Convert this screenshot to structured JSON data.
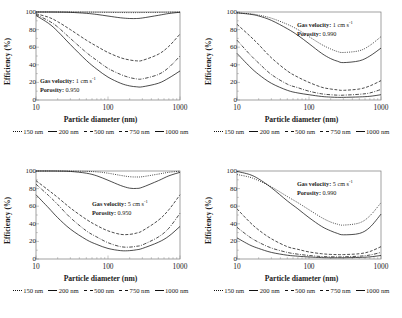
{
  "figure": {
    "axis": {
      "ylabel": "Efficiency (%)",
      "xlabel": "Particle diameter (nm)",
      "yticks": [
        "0",
        "20",
        "40",
        "60",
        "80",
        "100"
      ],
      "xticks": [
        "10",
        "100",
        "1000"
      ],
      "ylim": [
        0,
        100
      ],
      "xlim": [
        10,
        1000
      ],
      "xscale": "log"
    },
    "legend": {
      "entries": [
        {
          "label": "150 nm",
          "dash": "1,1.2",
          "width": 0.75
        },
        {
          "label": "200 nm",
          "dash": "none",
          "width": 0.75
        },
        {
          "label": "500 nm",
          "dash": "3,1.6",
          "width": 0.75
        },
        {
          "label": "750 nm",
          "dash": "3.5,1.4,0.9,1.4",
          "width": 0.75
        },
        {
          "label": "1000 nm",
          "dash": "none",
          "width": 0.85
        }
      ]
    },
    "panels": [
      {
        "id": "top-left",
        "annotation": {
          "gas_velocity_label": "Gas velocity:",
          "gas_velocity_value": "1 cm s",
          "gas_velocity_exponent": "-1",
          "porosity_label": "Porosity:",
          "porosity_value": "0.950"
        }
      },
      {
        "id": "top-right",
        "annotation": {
          "gas_velocity_label": "Gas velocity:",
          "gas_velocity_value": "1 cm s",
          "gas_velocity_exponent": "-1",
          "porosity_label": "Porosity:",
          "porosity_value": "0.990"
        }
      },
      {
        "id": "bottom-left",
        "annotation": {
          "gas_velocity_label": "Gas velocity:",
          "gas_velocity_value": "5 cm s",
          "gas_velocity_exponent": "-1",
          "porosity_label": "Porosity:",
          "porosity_value": "0.950"
        }
      },
      {
        "id": "bottom-right",
        "annotation": {
          "gas_velocity_label": "Gas velocity:",
          "gas_velocity_value": "5 cm s",
          "gas_velocity_exponent": "-1",
          "porosity_label": "Porosity:",
          "porosity_value": "0.990"
        }
      }
    ]
  },
  "chart_data": [
    {
      "type": "line",
      "panel": "top-left",
      "title": "",
      "xlabel": "Particle diameter (nm)",
      "ylabel": "Efficiency (%)",
      "xscale": "log",
      "xlim": [
        10,
        1000
      ],
      "ylim": [
        0,
        100
      ],
      "grid": false,
      "legend_position": "below",
      "annotations": [
        "Gas velocity: 1 cm s-1",
        "Porosity: 0.950"
      ],
      "x": [
        10,
        15,
        20,
        30,
        50,
        70,
        100,
        150,
        200,
        250,
        300,
        500,
        700,
        1000
      ],
      "series": [
        {
          "name": "150 nm",
          "values": [
            100,
            100,
            100,
            100,
            99.9,
            99.8,
            99.6,
            99.4,
            99.3,
            99.3,
            99.4,
            99.6,
            99.8,
            100
          ]
        },
        {
          "name": "200 nm",
          "values": [
            100,
            100,
            99.9,
            99.6,
            98.5,
            97.2,
            95.4,
            93.4,
            92.6,
            92.6,
            93.2,
            96.2,
            98.3,
            99.7
          ]
        },
        {
          "name": "500 nm",
          "values": [
            98,
            94,
            89,
            80,
            68,
            61,
            54,
            48,
            45.5,
            44.5,
            45,
            52,
            61,
            75
          ]
        },
        {
          "name": "750 nm",
          "values": [
            97,
            90,
            83,
            70,
            54,
            45,
            36,
            29,
            25.5,
            24,
            24,
            29,
            37,
            50
          ]
        },
        {
          "name": "1000 nm",
          "values": [
            96,
            87,
            78,
            63,
            45,
            35,
            26,
            19,
            16,
            15,
            15,
            19,
            25,
            33
          ]
        }
      ]
    },
    {
      "type": "line",
      "panel": "top-right",
      "title": "",
      "xlabel": "Particle diameter (nm)",
      "ylabel": "Efficiency (%)",
      "xscale": "log",
      "xlim": [
        10,
        1000
      ],
      "ylim": [
        0,
        100
      ],
      "grid": false,
      "legend_position": "below",
      "annotations": [
        "Gas velocity: 1 cm s-1",
        "Porosity: 0.990"
      ],
      "x": [
        10,
        15,
        20,
        30,
        50,
        70,
        100,
        150,
        200,
        250,
        300,
        500,
        700,
        1000
      ],
      "series": [
        {
          "name": "150 nm",
          "values": [
            99,
            98,
            96.5,
            93,
            86,
            80,
            72,
            63,
            58,
            55,
            54,
            56,
            62,
            72
          ]
        },
        {
          "name": "200 nm",
          "values": [
            99,
            97.5,
            95.5,
            90.5,
            81,
            73.5,
            64,
            53,
            47,
            44,
            42.5,
            44.5,
            50,
            59
          ]
        },
        {
          "name": "500 nm",
          "values": [
            86,
            73,
            63,
            48,
            33,
            26,
            20,
            14.5,
            12.5,
            11.5,
            11,
            12.5,
            16,
            22
          ]
        },
        {
          "name": "750 nm",
          "values": [
            68,
            52,
            42,
            29,
            18,
            14,
            10,
            7,
            6,
            5.5,
            5.5,
            6.5,
            8,
            12
          ]
        },
        {
          "name": "1000 nm",
          "values": [
            53,
            38,
            29,
            19,
            11,
            8,
            6,
            4,
            3.3,
            3,
            3,
            3.5,
            4.2,
            6
          ]
        }
      ]
    },
    {
      "type": "line",
      "panel": "bottom-left",
      "title": "",
      "xlabel": "Particle diameter (nm)",
      "ylabel": "Efficiency (%)",
      "xscale": "log",
      "xlim": [
        10,
        1000
      ],
      "ylim": [
        0,
        100
      ],
      "grid": false,
      "legend_position": "below",
      "annotations": [
        "Gas velocity: 5 cm s-1",
        "Porosity: 0.950"
      ],
      "x": [
        10,
        15,
        20,
        30,
        50,
        70,
        100,
        150,
        200,
        250,
        300,
        500,
        700,
        1000
      ],
      "series": [
        {
          "name": "150 nm",
          "values": [
            100,
            100,
            100,
            99.9,
            99.6,
            99,
            97.5,
            95,
            93.5,
            93.2,
            93.5,
            96.5,
            98.5,
            99.8
          ]
        },
        {
          "name": "200 nm",
          "values": [
            100,
            100,
            99.9,
            99.5,
            97.5,
            94.5,
            89.5,
            83.5,
            80.5,
            80.2,
            81.5,
            89,
            94.5,
            98.5
          ]
        },
        {
          "name": "500 nm",
          "values": [
            89,
            78,
            70,
            58,
            45,
            38,
            32,
            28,
            28,
            29.5,
            32,
            44,
            56,
            73
          ]
        },
        {
          "name": "750 nm",
          "values": [
            85,
            72,
            62,
            47,
            32,
            25,
            18.5,
            14,
            13.5,
            14.5,
            16,
            25,
            35,
            52
          ]
        },
        {
          "name": "1000 nm",
          "values": [
            73,
            58,
            47,
            34,
            22,
            16.5,
            12,
            9.5,
            9.5,
            10.5,
            12,
            19,
            26,
            37
          ]
        }
      ]
    },
    {
      "type": "line",
      "panel": "bottom-right",
      "title": "",
      "xlabel": "Particle diameter (nm)",
      "ylabel": "Efficiency (%)",
      "xscale": "log",
      "xlim": [
        10,
        1000
      ],
      "ylim": [
        0,
        100
      ],
      "grid": false,
      "legend_position": "below",
      "annotations": [
        "Gas velocity: 5 cm s-1",
        "Porosity: 0.990"
      ],
      "x": [
        10,
        15,
        20,
        30,
        50,
        70,
        100,
        150,
        200,
        250,
        300,
        500,
        700,
        1000
      ],
      "series": [
        {
          "name": "150 nm",
          "values": [
            96,
            93,
            89,
            82,
            71,
            64,
            56,
            47,
            42,
            39.5,
            38.5,
            41,
            49,
            64
          ]
        },
        {
          "name": "200 nm",
          "values": [
            99.5,
            96,
            91,
            81,
            66,
            57,
            47,
            37,
            32,
            29,
            27.5,
            29,
            36,
            51
          ]
        },
        {
          "name": "500 nm",
          "values": [
            57,
            42,
            33,
            23,
            14,
            11,
            8,
            6,
            5.2,
            5,
            5,
            6,
            8.5,
            14
          ]
        },
        {
          "name": "750 nm",
          "values": [
            36,
            25,
            19,
            12.5,
            7.5,
            5.5,
            4,
            2.8,
            2.5,
            2.4,
            2.5,
            3.2,
            4.5,
            7.5
          ]
        },
        {
          "name": "1000 nm",
          "values": [
            24,
            16,
            12,
            7.5,
            4.3,
            3.2,
            2.3,
            1.6,
            1.4,
            1.4,
            1.4,
            1.8,
            2.4,
            4
          ]
        }
      ]
    }
  ]
}
